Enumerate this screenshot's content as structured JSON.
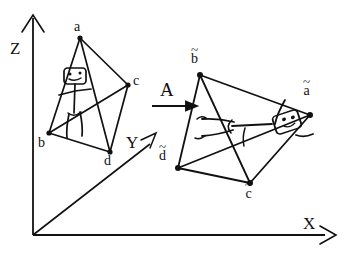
{
  "diagram": {
    "ink_color": "#111111",
    "background": "#ffffff",
    "axes": {
      "z_label": "Z",
      "y_label": "Y",
      "x_label": "X",
      "origin": [
        33,
        235
      ]
    },
    "map": {
      "label": "A",
      "arrow": "right-arrow"
    },
    "source_object": {
      "name": "tetrahedron",
      "vertices": [
        {
          "id": "a",
          "label": "a",
          "x": 80,
          "y": 38,
          "label_x": 74,
          "label_y": 23
        },
        {
          "id": "b",
          "label": "b",
          "x": 49,
          "y": 133,
          "label_x": 40,
          "label_y": 137
        },
        {
          "id": "c",
          "label": "c",
          "x": 128,
          "y": 85,
          "label_x": 133,
          "label_y": 77
        },
        {
          "id": "d",
          "label": "d",
          "x": 110,
          "y": 152,
          "label_x": 104,
          "label_y": 156
        }
      ],
      "figure": "stick-figure-upright"
    },
    "target_object": {
      "name": "tetrahedron-transformed",
      "vertices": [
        {
          "id": "a-tilde",
          "label": "a",
          "accent": "~",
          "x": 310,
          "y": 115,
          "label_x": 308,
          "label_y": 89
        },
        {
          "id": "b-tilde",
          "label": "b",
          "accent": "~",
          "x": 200,
          "y": 75,
          "label_x": 193,
          "label_y": 52
        },
        {
          "id": "c-tilde",
          "label": "c",
          "accent": "~",
          "x": 250,
          "y": 183,
          "label_x": 246,
          "label_y": 185
        },
        {
          "id": "d-tilde",
          "label": "d",
          "accent": "~",
          "x": 178,
          "y": 168,
          "label_x": 163,
          "label_y": 147
        }
      ],
      "figure": "stick-figure-sheared"
    }
  }
}
